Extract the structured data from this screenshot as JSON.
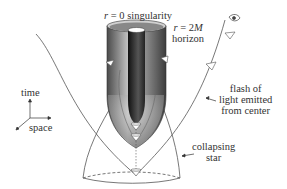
{
  "diagram": {
    "labels": {
      "singularity": {
        "var": "r",
        "eq": " = 0 singularity"
      },
      "horizon_line1": {
        "var": "r",
        "eq": " = 2",
        "var2": "M"
      },
      "horizon_line2": "horizon",
      "flash_line1": "flash of",
      "flash_line2": "light emitted",
      "flash_line3": "from center",
      "star_line1": "collapsing",
      "star_line2": "star",
      "axis_time": "time",
      "axis_space": "space"
    },
    "icons": [
      "eye-icon",
      "light-cone-icon"
    ],
    "colors": {
      "cylinder_dark": "#3a3a3a",
      "cylinder_light": "#c8c8c8",
      "line": "#555555",
      "background": "#ffffff"
    }
  }
}
